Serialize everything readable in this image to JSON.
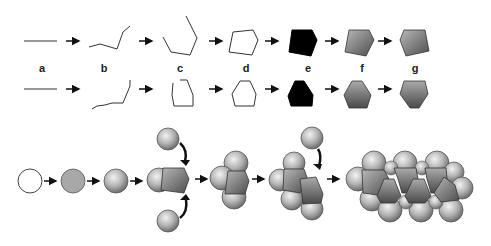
{
  "figure": {
    "step_labels": [
      "a",
      "b",
      "c",
      "d",
      "e",
      "f",
      "g"
    ],
    "label_positions_x": [
      42,
      104,
      180,
      246,
      308,
      362,
      415
    ],
    "label_y": 62,
    "colors": {
      "line": "#333333",
      "black_fill": "#000000",
      "gray_fill_dark": "#555555",
      "gray_fill_light": "#b8b8b8",
      "sphere_light": "#eeeeee",
      "sphere_dark": "#7a7a7a",
      "plain_gray": "#a9a9a9",
      "arrow": "#111111"
    },
    "rows": [
      {
        "name": "pentagon-row",
        "y": 41
      },
      {
        "name": "hexagon-row",
        "y": 89
      }
    ],
    "bottom_sequence": {
      "stages": [
        "empty-circle",
        "gray-sphere",
        "shaded-sphere",
        "sphere-plus-pentagon",
        "triple-assembly",
        "double-unit",
        "final-cluster"
      ]
    }
  }
}
